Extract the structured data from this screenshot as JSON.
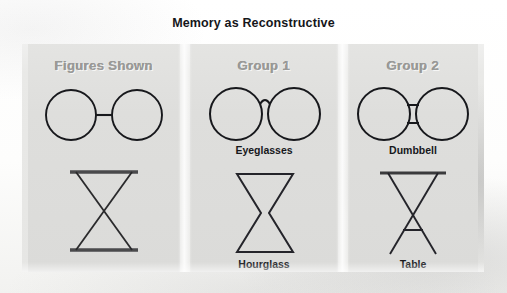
{
  "title": "Memory as Reconstructive",
  "columns": [
    {
      "header": "Figures Shown"
    },
    {
      "header": "Group 1"
    },
    {
      "header": "Group 2"
    }
  ],
  "rows": [
    {
      "stimulus": "two circles joined by a short thin horizontal line",
      "group1_label": "Eyeglasses",
      "group2_label": "Dumbbell"
    },
    {
      "stimulus": "two crossed diagonal lines between a top and a bottom horizontal bar",
      "group1_label": "Hourglass",
      "group2_label": "Table"
    }
  ],
  "colors": {
    "ink": "#17181c",
    "header_text": "#9a9a98",
    "panel": "#dedede",
    "page": "#ffffff"
  }
}
